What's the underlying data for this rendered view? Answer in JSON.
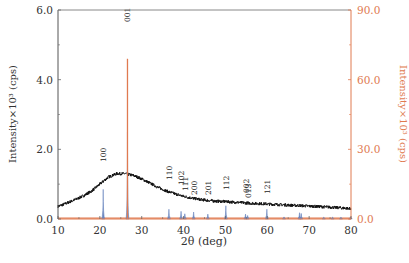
{
  "chart_data": {
    "type": "line",
    "title": "",
    "xlabel": "2θ (deg)",
    "ylabel_left": "Intensity×10³ (cps)",
    "ylabel_right": "Intensity×10³ (cps)",
    "xlim": [
      10,
      80
    ],
    "ylim_left": [
      0,
      6.0
    ],
    "ylim_right": [
      0,
      90.0
    ],
    "x_ticks": [
      10,
      20,
      30,
      40,
      50,
      60,
      70,
      80
    ],
    "y_ticks_left": [
      "0.0",
      "2.0",
      "4.0",
      "6.0"
    ],
    "y_ticks_right": [
      "0.0",
      "30.0",
      "60.0",
      "90.0"
    ],
    "grid": false,
    "colors": {
      "left_axis": "#555555",
      "right_axis": "#e07a50",
      "measured": "#111111",
      "reference_orange": "#e07a50",
      "reference_blue": "#6a86c0"
    },
    "series": [
      {
        "name": "measured (amorphous + crystalline)",
        "axis": "left",
        "color": "#111111",
        "x": [
          10,
          12,
          14,
          16,
          18,
          20,
          22,
          24,
          26,
          28,
          30,
          32,
          34,
          36,
          38,
          40,
          42,
          44,
          46,
          48,
          50,
          55,
          60,
          65,
          70,
          75,
          80
        ],
        "y": [
          0.36,
          0.45,
          0.55,
          0.66,
          0.8,
          1.0,
          1.2,
          1.3,
          1.3,
          1.25,
          1.15,
          1.03,
          0.9,
          0.8,
          0.72,
          0.65,
          0.6,
          0.56,
          0.53,
          0.51,
          0.5,
          0.46,
          0.43,
          0.4,
          0.37,
          0.34,
          0.3
        ]
      },
      {
        "name": "reference pattern (orange, right axis)",
        "axis": "right",
        "color": "#e07a50",
        "peaks": [
          {
            "x": 26.6,
            "y": 69.0,
            "label": "001"
          }
        ]
      },
      {
        "name": "reference pattern (blue, left axis)",
        "axis": "left",
        "color": "#6a86c0",
        "peaks": [
          {
            "x": 20.8,
            "y": 0.85,
            "label": "100"
          },
          {
            "x": 26.6,
            "y": 2.5,
            "label": "001"
          },
          {
            "x": 36.5,
            "y": 0.28,
            "label": "110"
          },
          {
            "x": 39.4,
            "y": 0.22,
            "label": "102"
          },
          {
            "x": 40.3,
            "y": 0.15,
            "label": "111"
          },
          {
            "x": 42.4,
            "y": 0.2,
            "label": "200"
          },
          {
            "x": 45.8,
            "y": 0.14,
            "label": "201"
          },
          {
            "x": 50.1,
            "y": 0.38,
            "label": "112"
          },
          {
            "x": 54.8,
            "y": 0.14,
            "label": "002"
          },
          {
            "x": 55.3,
            "y": 0.1,
            "label": "013"
          },
          {
            "x": 59.9,
            "y": 0.28,
            "label": "121"
          },
          {
            "x": 64.0,
            "y": 0.06,
            "label": ""
          },
          {
            "x": 67.7,
            "y": 0.18,
            "label": ""
          },
          {
            "x": 68.1,
            "y": 0.16,
            "label": ""
          },
          {
            "x": 73.5,
            "y": 0.05,
            "label": ""
          },
          {
            "x": 75.6,
            "y": 0.05,
            "label": ""
          },
          {
            "x": 77.6,
            "y": 0.05,
            "label": ""
          },
          {
            "x": 79.9,
            "y": 0.06,
            "label": ""
          }
        ]
      }
    ],
    "annotations": [
      {
        "text": "001",
        "x": 26.6,
        "y_px": 22
      },
      {
        "text": "100",
        "x": 20.8,
        "y_px": 162
      },
      {
        "text": "110",
        "x": 36.5,
        "y_px": 180
      },
      {
        "text": "102",
        "x": 39.4,
        "y_px": 185
      },
      {
        "text": "111",
        "x": 40.3,
        "y_px": 191
      },
      {
        "text": "200",
        "x": 42.4,
        "y_px": 195
      },
      {
        "text": "201",
        "x": 45.8,
        "y_px": 195
      },
      {
        "text": "112",
        "x": 50.1,
        "y_px": 190
      },
      {
        "text": "002",
        "x": 54.8,
        "y_px": 193
      },
      {
        "text": "013",
        "x": 55.3,
        "y_px": 198
      },
      {
        "text": "121",
        "x": 59.9,
        "y_px": 194
      }
    ]
  }
}
